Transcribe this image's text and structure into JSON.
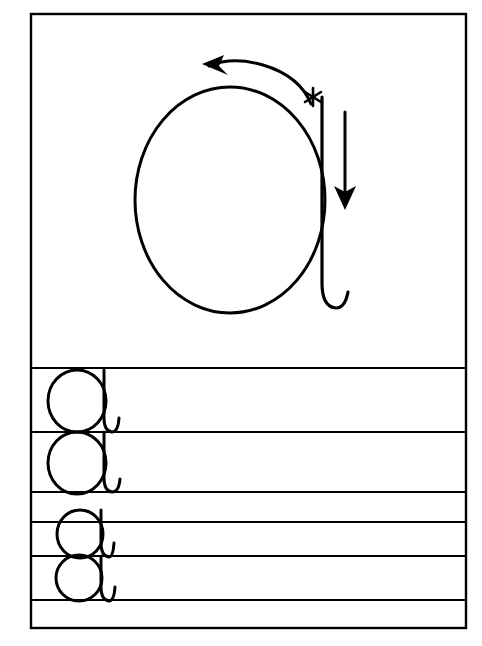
{
  "document": {
    "kind": "handwriting-practice-worksheet",
    "letter": "a",
    "title": "",
    "background_color": "#ffffff",
    "ink_color": "#000000",
    "frame": {
      "x": 31,
      "y": 14,
      "width": 435,
      "height": 614,
      "stroke_width": 2.4
    }
  },
  "demonstration": {
    "label": "",
    "letter_shape": "a",
    "oval": {
      "center_x": 230,
      "center_y": 200,
      "radius_x": 95,
      "radius_y": 113,
      "stroke_width": 3.0
    },
    "stem": {
      "top_x": 322,
      "top_y": 97,
      "bottom_y": 300,
      "hook_end_x": 345,
      "hook_end_y": 305,
      "stroke_width": 3.2
    },
    "direction_arrow": {
      "name": "counterclockwise-arrow",
      "description": "curved arrow over top of oval pointing left",
      "head_x": 204,
      "head_y": 65,
      "tail_x": 311,
      "tail_y": 104
    },
    "down_arrow": {
      "name": "down-arrow",
      "description": "straight vertical arrow pointing down beside the stem",
      "x": 345,
      "top_y": 112,
      "bottom_y": 208
    },
    "start_marker": {
      "name": "asterisk-start-mark",
      "glyph": "*",
      "x": 313,
      "y": 97
    }
  },
  "practice_area": {
    "rule_lines_y": [
      368,
      432,
      492,
      522,
      556,
      600
    ],
    "rule_line_stroke_width": 2.2,
    "rule_line_x_start": 31,
    "rule_line_x_end": 466,
    "rows": [
      {
        "index": 1,
        "letter": "a",
        "baseline_y": 432,
        "top_y": 370,
        "oval_center_x": 77,
        "oval_center_y": 401,
        "oval_radius_x": 29,
        "oval_radius_y": 31,
        "stem_x": 104,
        "stem_top_y": 370,
        "stem_bottom_y": 425,
        "hook_end_x": 118,
        "hook_end_y": 429
      },
      {
        "index": 2,
        "letter": "a",
        "baseline_y": 492,
        "top_y": 432,
        "oval_center_x": 77,
        "oval_center_y": 463,
        "oval_radius_x": 29,
        "oval_radius_y": 31,
        "stem_x": 104,
        "stem_top_y": 432,
        "stem_bottom_y": 485,
        "hook_end_x": 119,
        "hook_end_y": 490
      },
      {
        "index": 3,
        "letter": "a",
        "baseline_y": 556,
        "top_y": 510,
        "oval_center_x": 80,
        "oval_center_y": 534,
        "oval_radius_x": 23,
        "oval_radius_y": 24,
        "stem_x": 101,
        "stem_top_y": 510,
        "stem_bottom_y": 550,
        "hook_end_x": 113,
        "hook_end_y": 554
      },
      {
        "index": 4,
        "letter": "a",
        "baseline_y": 600,
        "top_y": 556,
        "oval_center_x": 79,
        "oval_center_y": 578,
        "oval_radius_x": 23,
        "oval_radius_y": 23,
        "stem_x": 101,
        "stem_top_y": 556,
        "stem_bottom_y": 594,
        "hook_end_x": 114,
        "hook_end_y": 598
      }
    ]
  },
  "accessibility": {
    "summary": "Handwriting practice worksheet for the lowercase letter a. A large demonstration letter at the top shows an oval with a counterclockwise curved arrow, an asterisk marking the starting point, and a downward arrow showing the stem stroke direction. Below, four practice letter a shapes are written on ruled lines."
  }
}
